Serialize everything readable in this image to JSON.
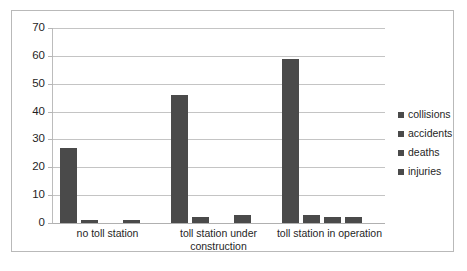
{
  "chart_data": {
    "type": "bar",
    "title": "",
    "xlabel": "",
    "ylabel": "",
    "ylim": [
      0,
      70
    ],
    "yticks": [
      0,
      10,
      20,
      30,
      40,
      50,
      60,
      70
    ],
    "grid": true,
    "legend_position": "right",
    "bar_color": "#4a4a4a",
    "categories": [
      "no toll station",
      "toll station under construction",
      "toll station in operation"
    ],
    "category_lines": [
      [
        "no toll station"
      ],
      [
        "toll station under",
        "construction"
      ],
      [
        "toll station in operation"
      ]
    ],
    "series": [
      {
        "name": "collisions",
        "values": [
          27,
          46,
          59
        ]
      },
      {
        "name": "accidents",
        "values": [
          1,
          2,
          3
        ]
      },
      {
        "name": "deaths",
        "values": [
          0,
          0,
          2
        ]
      },
      {
        "name": "injuries",
        "values": [
          1,
          3,
          2
        ]
      }
    ]
  },
  "legend": {
    "items": [
      "collisions",
      "accidents",
      "deaths",
      "injuries"
    ]
  }
}
